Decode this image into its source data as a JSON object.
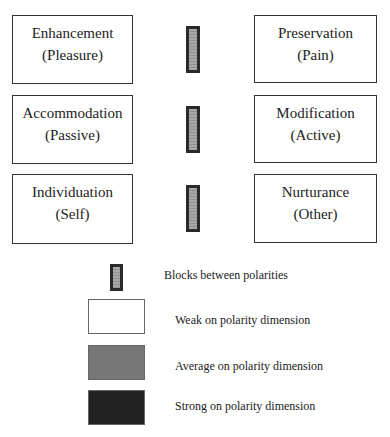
{
  "polarities": [
    {
      "left": {
        "title": "Enhancement",
        "subtitle": "(Pleasure)"
      },
      "right": {
        "title": "Preservation",
        "subtitle": "(Pain)"
      }
    },
    {
      "left": {
        "title": "Accommodation",
        "subtitle": "(Passive)"
      },
      "right": {
        "title": "Modification",
        "subtitle": "(Active)"
      }
    },
    {
      "left": {
        "title": "Individuation",
        "subtitle": "(Self)"
      },
      "right": {
        "title": "Nurturance",
        "subtitle": "(Other)"
      }
    }
  ],
  "legend": {
    "blocks_label": "Blocks between polarities",
    "weak_label": "Weak on polarity dimension",
    "average_label": "Average on polarity dimension",
    "strong_label": "Strong on polarity dimension",
    "colors": {
      "weak": "#ffffff",
      "average": "#777777",
      "strong": "#222222"
    }
  }
}
